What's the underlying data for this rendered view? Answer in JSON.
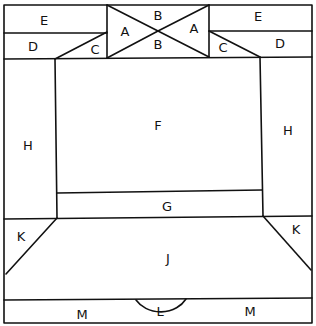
{
  "diagram": {
    "type": "quilt-block-layout",
    "labels": {
      "A_left": "A",
      "A_right": "A",
      "B_top": "B",
      "B_bottom": "B",
      "C_left": "C",
      "C_right": "C",
      "D_left": "D",
      "D_right": "D",
      "E_left": "E",
      "E_right": "E",
      "F": "F",
      "G": "G",
      "H_left": "H",
      "H_right": "H",
      "J": "J",
      "K_left": "K",
      "K_right": "K",
      "L": "L",
      "M_left": "M",
      "M_right": "M"
    },
    "line_color": "#111111",
    "background": "#ffffff"
  }
}
